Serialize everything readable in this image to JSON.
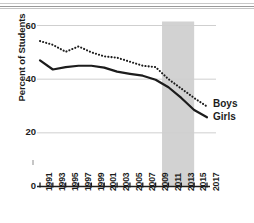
{
  "chart_data": {
    "type": "line",
    "title": "",
    "xlabel": "",
    "ylabel": "Percent of Students",
    "ylim": [
      0,
      60
    ],
    "yticks": [
      0,
      20,
      40,
      60
    ],
    "ytick_labels": [
      "0",
      "20",
      "40",
      "60"
    ],
    "grid": "horizontal",
    "legend_position": "inline-right",
    "x": [
      1991,
      1993,
      1995,
      1997,
      1999,
      2001,
      2003,
      2005,
      2007,
      2009,
      2011,
      2013,
      2015,
      2017
    ],
    "xtick_labels": [
      "1991",
      "1993",
      "1995",
      "1997",
      "1999",
      "2001",
      "2003",
      "2005",
      "2007",
      "2009",
      "2011",
      "2013",
      "2015",
      "2017"
    ],
    "series": [
      {
        "name": "Boys",
        "style": "dotted",
        "color": "#1c1c1c",
        "values": [
          54.2,
          52.8,
          50.2,
          52.2,
          50.0,
          48.5,
          48.0,
          46.5,
          45.0,
          44.5,
          40.0,
          36.5,
          33.0,
          29.8
        ]
      },
      {
        "name": "Girls",
        "style": "solid",
        "color": "#1c1c1c",
        "values": [
          47.0,
          43.6,
          44.5,
          45.0,
          45.0,
          44.3,
          42.8,
          42.0,
          41.3,
          39.8,
          37.0,
          33.0,
          28.5,
          25.8
        ]
      }
    ],
    "annotations": [
      {
        "name": "shaded-band",
        "type": "vspan",
        "x_start": 2010,
        "x_end": 2015,
        "color": "#d2d2d2"
      }
    ]
  },
  "axis": {
    "y_axis_label": "Percent of Students",
    "y_tick_0": "0",
    "y_tick_20": "20",
    "y_tick_40": "40",
    "y_tick_60": "60"
  },
  "legend": {
    "boys_label": "Boys",
    "girls_label": "Girls"
  },
  "colors": {
    "line": "#1c1c1c",
    "grid": "#cfcfcf",
    "band": "#d2d2d2",
    "background": "#ffffff"
  }
}
